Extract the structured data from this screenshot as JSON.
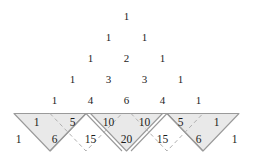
{
  "figure": {
    "rows_label": "Pascal's triangle rows 0 through 6",
    "colors": {
      "shade_fill": "#e9e9e9",
      "solid_stroke": "#9a9a9a",
      "dashed_stroke": "#b0b0b0",
      "text": "#1c1c1c",
      "background": "#ffffff"
    }
  },
  "pascal": {
    "rows": [
      {
        "index": 0,
        "values": [
          "1"
        ]
      },
      {
        "index": 1,
        "values": [
          "1",
          "1"
        ]
      },
      {
        "index": 2,
        "values": [
          "1",
          "2",
          "1"
        ]
      },
      {
        "index": 3,
        "values": [
          "1",
          "3",
          "3",
          "1"
        ]
      },
      {
        "index": 4,
        "values": [
          "1",
          "4",
          "6",
          "4",
          "1"
        ]
      },
      {
        "index": 5,
        "values": [
          "1",
          "5",
          "10",
          "10",
          "5",
          "1"
        ]
      },
      {
        "index": 6,
        "values": [
          "1",
          "6",
          "15",
          "20",
          "15",
          "6",
          "1"
        ]
      }
    ]
  },
  "layout": {
    "row_y": [
      16,
      37,
      58,
      79,
      100,
      121,
      139
    ],
    "center_x": 126.5,
    "x_step": 36,
    "baseline_y": 113.5,
    "baseline_x_left": 14,
    "baseline_x_right": 239,
    "apex_y": 151
  },
  "regions": {
    "shaded": [
      {
        "name": "left-outer-triangle",
        "labels": [
          "1",
          "6"
        ]
      },
      {
        "name": "center-triangle",
        "labels": [
          "10",
          "10",
          "20"
        ]
      },
      {
        "name": "right-outer-triangle",
        "labels": [
          "1",
          "6"
        ]
      }
    ],
    "dashed": [
      {
        "name": "left-dashed-triangle",
        "labels": [
          "5",
          "15"
        ]
      },
      {
        "name": "right-dashed-triangle",
        "labels": [
          "5",
          "15"
        ]
      }
    ]
  }
}
